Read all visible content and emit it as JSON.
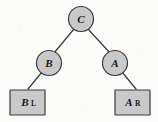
{
  "figure": {
    "kind": "binary-tree-diagram",
    "background_color": "#fbfbfa",
    "node_fill_color": "#c9c9c9",
    "node_stroke_color": "#3a3a3c",
    "edge_color": "#3c3c40",
    "text_color": "#17171a"
  },
  "nodes": {
    "root": {
      "label": "C",
      "subscript": "",
      "shape": "circle"
    },
    "left_internal": {
      "label": "B",
      "subscript": "",
      "shape": "circle"
    },
    "right_internal": {
      "label": "A",
      "subscript": "",
      "shape": "circle"
    },
    "left_leaf": {
      "label": "B",
      "subscript": "L",
      "shape": "rectangle"
    },
    "right_leaf": {
      "label": "A",
      "subscript": "R",
      "shape": "rectangle"
    }
  },
  "edges": [
    {
      "from": "C",
      "to": "B"
    },
    {
      "from": "C",
      "to": "A"
    },
    {
      "from": "B",
      "to": "B_L"
    },
    {
      "from": "A",
      "to": "A_R"
    }
  ]
}
